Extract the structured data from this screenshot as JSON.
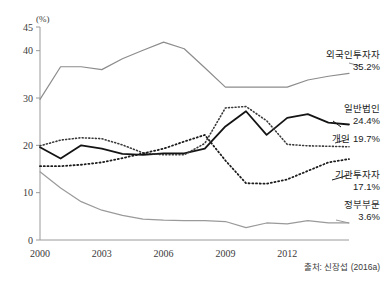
{
  "chart_data": {
    "type": "line",
    "title": "",
    "subtitle": "",
    "xlabel": "",
    "ylabel": "(%)",
    "unit_label": "(%)",
    "source": "출처: 신장섭 (2016a)",
    "grid": false,
    "legend_position": "right-inline",
    "xlim": [
      2000,
      2015
    ],
    "ylim": [
      0,
      45
    ],
    "yticks": [
      0,
      10,
      20,
      30,
      40,
      45
    ],
    "ytick_labels": [
      "0",
      "10",
      "20",
      "30",
      "40",
      "45"
    ],
    "xticks": [
      2000,
      2003,
      2006,
      2009,
      2012
    ],
    "xtick_labels": [
      "2000",
      "2003",
      "2006",
      "2009",
      "2012"
    ],
    "x": [
      2000,
      2001,
      2002,
      2003,
      2004,
      2005,
      2006,
      2007,
      2008,
      2009,
      2010,
      2011,
      2012,
      2013,
      2014,
      2015
    ],
    "series": [
      {
        "name": "외국인투자자",
        "label": "외국인투자자",
        "value_label": "35.2%",
        "final_value": 35.2,
        "color": "#8c8c8c",
        "style": "solid",
        "width": 1.2,
        "values": [
          29.7,
          36.6,
          36.6,
          36.0,
          38.3,
          40.1,
          41.8,
          40.4,
          36.4,
          32.3,
          32.3,
          32.3,
          32.3,
          33.8,
          34.6,
          35.2
        ]
      },
      {
        "name": "일반법인",
        "label": "일반법인",
        "value_label": "24.4%",
        "final_value": 24.4,
        "color": "#141414",
        "style": "solid",
        "width": 1.8,
        "values": [
          19.6,
          17.2,
          20.0,
          19.3,
          18.2,
          18.0,
          18.3,
          18.3,
          19.3,
          24.0,
          27.2,
          22.2,
          25.8,
          26.6,
          24.8,
          24.4
        ]
      },
      {
        "name": "개인",
        "label": "개인",
        "value_label": "19.7%",
        "final_value": 19.7,
        "color": "#3a3a3a",
        "style": "dotted",
        "width": 1.6,
        "values": [
          19.9,
          21.1,
          21.6,
          21.4,
          20.1,
          18.4,
          18.0,
          18.0,
          20.4,
          27.9,
          28.2,
          25.2,
          20.2,
          19.9,
          19.8,
          19.7
        ]
      },
      {
        "name": "기관투자자",
        "label": "기관투자자",
        "value_label": "17.1%",
        "final_value": 17.1,
        "color": "#1c1c1c",
        "style": "dotted",
        "width": 1.8,
        "values": [
          15.6,
          15.6,
          15.9,
          16.4,
          17.3,
          18.3,
          19.3,
          20.8,
          22.2,
          16.8,
          12.0,
          11.9,
          12.8,
          14.6,
          16.4,
          17.1
        ]
      },
      {
        "name": "정부부문",
        "label": "정부부문",
        "value_label": "3.6%",
        "final_value": 3.6,
        "color": "#9a9a9a",
        "style": "solid",
        "width": 1.2,
        "values": [
          14.4,
          11.0,
          8.1,
          6.3,
          5.2,
          4.4,
          4.2,
          4.1,
          4.1,
          3.9,
          2.6,
          3.6,
          3.4,
          4.1,
          3.6,
          3.6
        ]
      }
    ]
  },
  "annotations": {
    "foreign": {
      "label": "외국인투자자",
      "value": "35.2%"
    },
    "corporate": {
      "label": "일반법인",
      "value": "24.4%"
    },
    "individual": {
      "label": "개인 19.7%"
    },
    "institutional": {
      "label": "기관투자자",
      "value": "17.1%"
    },
    "government": {
      "label": "정부부문",
      "value": "3.6%"
    }
  },
  "footer": {
    "source": "출처: 신장섭 (2016a)"
  }
}
